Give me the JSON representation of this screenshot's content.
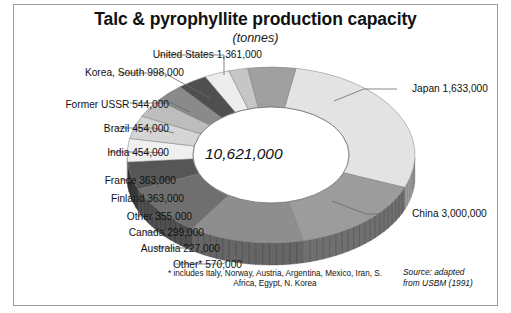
{
  "chart_data": {
    "type": "pie",
    "title": "Talc & pyrophyllite production capacity",
    "subtitle": "(tonnes)",
    "unit": "tonnes",
    "center_total": "10,621,000",
    "total_value": 10621000,
    "legend_position": "callout-labels",
    "grid": false,
    "categories": [
      "China",
      "Japan",
      "United States",
      "Korea, South",
      "Former USSR",
      "Brazil",
      "India",
      "France",
      "Finland",
      "Other",
      "Canada",
      "Australia",
      "Other*"
    ],
    "values": [
      3000000,
      1633000,
      1361000,
      998000,
      544000,
      454000,
      454000,
      363000,
      363000,
      355000,
      299000,
      227000,
      570000
    ],
    "labels": [
      "China 3,000,000",
      "Japan 1,633,000",
      "United States 1,361,000",
      "Korea, South 998,000",
      "Former USSR 544,000",
      "Brazil 454,000",
      "India 454,000",
      "France 363,000",
      "Finland 363,000",
      "Other 355,000",
      "Canada 299,000",
      "Australia 227,000",
      "Other* 570,000"
    ],
    "slice_colors": [
      "#e3e3e3",
      "#9c9c9c",
      "#8e8e8e",
      "#6f6f6f",
      "#565656",
      "#f0f0f0",
      "#d5d5d5",
      "#bdbdbd",
      "#8a8a8a",
      "#4f4f4f",
      "#ededed",
      "#c6c6c6",
      "#a0a0a0"
    ],
    "annotations": [
      "* includes Italy, Norway, Austria, Argentina, Mexico, Iran, S. Africa, Egypt, N. Korea",
      "Source: adapted from USBM (1991)"
    ],
    "footnote": "* includes Italy, Norway, Austria, Argentina, Mexico, Iran, S. Africa, Egypt, N. Korea",
    "source_line1": "Source: adapted",
    "source_line2": "from USBM (1991)"
  },
  "labels": {
    "united_states": "United States 1,361,000",
    "korea_south": "Korea, South 998,000",
    "former_ussr": "Former USSR 544,000",
    "brazil": "Brazil 454,000",
    "india": "India 454,000",
    "france": "France 363,000",
    "finland": "Finland 363,000",
    "other": "Other 355,000",
    "canada": "Canada 299,000",
    "australia": "Australia 227,000",
    "other_star": "Other*  570,000",
    "japan": "Japan 1,633,000",
    "china": "China 3,000,000"
  }
}
